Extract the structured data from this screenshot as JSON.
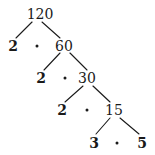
{
  "diagram": {
    "type": "factor-tree",
    "root": "120",
    "colors": {
      "ink": "#1a1a1a",
      "background": "#ffffff"
    },
    "levels": [
      {
        "left": "2",
        "right": "60",
        "separator": "·"
      },
      {
        "left": "2",
        "right": "30",
        "separator": "·"
      },
      {
        "left": "2",
        "right": "15",
        "separator": "·"
      },
      {
        "left": "3",
        "right": "5",
        "separator": "·"
      }
    ],
    "nodes": {
      "n120": "120",
      "n2a": "2",
      "n60": "60",
      "n2b": "2",
      "n30": "30",
      "n2c": "2",
      "n15": "15",
      "n3": "3",
      "n5": "5"
    },
    "prime_factors": [
      "2",
      "2",
      "2",
      "3",
      "5"
    ]
  }
}
